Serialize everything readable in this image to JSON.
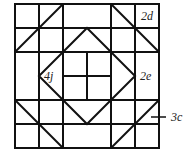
{
  "diagram": {
    "type": "quilt-block-pattern",
    "grid": {
      "rows": 6,
      "cols": 6,
      "origin_x": 15,
      "origin_y": 4,
      "cell": 24
    },
    "stroke_color": "#111111",
    "stroke_width": 2,
    "labels": [
      {
        "id": "2d",
        "text": "2d",
        "x": 141,
        "y": 20
      },
      {
        "id": "4j",
        "text": "4j",
        "x": 44,
        "y": 80
      },
      {
        "id": "2e",
        "text": "2e",
        "x": 140,
        "y": 80
      },
      {
        "id": "3c",
        "text": "3c",
        "x": 171,
        "y": 121
      }
    ],
    "leader_line": {
      "x1": 151,
      "y1": 117,
      "x2": 166,
      "y2": 117
    }
  }
}
